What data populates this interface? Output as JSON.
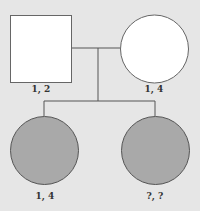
{
  "pedigree": {
    "parents": {
      "father": {
        "shape": "square",
        "affected": false,
        "label": "1, 2"
      },
      "mother": {
        "shape": "circle",
        "affected": false,
        "label": "1, 4"
      }
    },
    "children": [
      {
        "shape": "circle",
        "affected": true,
        "label": "1, 4"
      },
      {
        "shape": "circle",
        "affected": true,
        "label": "?, ?"
      }
    ]
  },
  "colors": {
    "background": "#e6e6e6",
    "unaffected_fill": "#ffffff",
    "affected_fill": "#a9a9a9",
    "line": "#555555"
  }
}
